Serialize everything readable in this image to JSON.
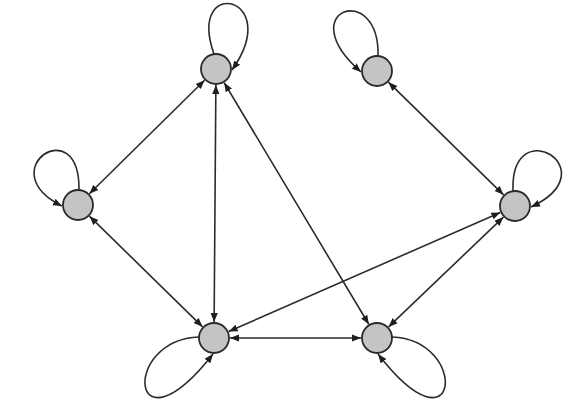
{
  "diagram": {
    "type": "directed-graph",
    "node_fill": "#c4c4c4",
    "node_stroke": "#2a2a2a",
    "edge_color": "#2b2b2b",
    "node_radius": 15,
    "nodes": [
      {
        "id": "n1",
        "x": 216,
        "y": 69,
        "loop": {
          "cx1": 186,
          "cy1": -25,
          "cx2": 285,
          "cy2": -5,
          "dir": "top-right"
        }
      },
      {
        "id": "n2",
        "x": 377,
        "y": 71,
        "loop": {
          "cx1": 380,
          "cy1": -20,
          "cx2": 290,
          "cy2": 10,
          "dir": "top-left"
        }
      },
      {
        "id": "n3",
        "x": 78,
        "y": 205,
        "loop": {
          "cx1": 80,
          "cy1": 110,
          "cx2": -10,
          "cy2": 170,
          "dir": "top-left"
        }
      },
      {
        "id": "n4",
        "x": 515,
        "y": 206,
        "loop": {
          "cx1": 510,
          "cy1": 110,
          "cx2": 610,
          "cy2": 170,
          "dir": "top-right"
        }
      },
      {
        "id": "n5",
        "x": 214,
        "y": 338,
        "loop": {
          "cx1": 120,
          "cy1": 340,
          "cx2": 130,
          "cy2": 460,
          "dir": "bottom-left"
        }
      },
      {
        "id": "n6",
        "x": 377,
        "y": 338,
        "loop": {
          "cx1": 470,
          "cy1": 340,
          "cx2": 460,
          "cy2": 460,
          "dir": "bottom-right"
        }
      }
    ],
    "edges": [
      {
        "from": "n1",
        "to": "n3",
        "bidirectional": true
      },
      {
        "from": "n1",
        "to": "n5",
        "bidirectional": true
      },
      {
        "from": "n1",
        "to": "n6",
        "bidirectional": true
      },
      {
        "from": "n3",
        "to": "n5",
        "bidirectional": true
      },
      {
        "from": "n5",
        "to": "n6",
        "bidirectional": true
      },
      {
        "from": "n5",
        "to": "n4",
        "bidirectional": true
      },
      {
        "from": "n2",
        "to": "n4",
        "bidirectional": true
      },
      {
        "from": "n4",
        "to": "n6",
        "bidirectional": true
      }
    ]
  }
}
